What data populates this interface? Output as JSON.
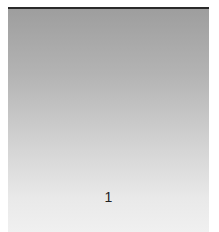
{
  "thumbnail": {
    "page_number": "1",
    "colors": {
      "top_border": "#2a2a2a",
      "gradient_top": "#9e9e9e",
      "gradient_bottom": "#f0f0f0"
    }
  }
}
